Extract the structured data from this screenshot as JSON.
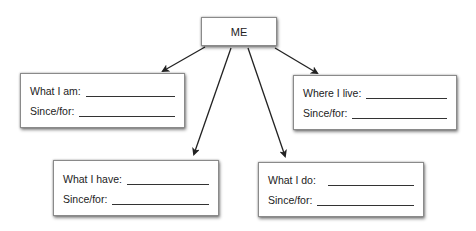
{
  "center": {
    "label": "ME"
  },
  "boxes": [
    {
      "id": "what-i-am",
      "field": "What I am:",
      "since": "Since/for:"
    },
    {
      "id": "where-i-live",
      "field": "Where I live:",
      "since": "Since/for:"
    },
    {
      "id": "what-i-have",
      "field": "What I have:",
      "since": "Since/for:"
    },
    {
      "id": "what-i-do",
      "field": "What I do:",
      "since": "Since/for:"
    }
  ],
  "colors": {
    "arrow": "#222222",
    "border": "#8a8a8a"
  }
}
